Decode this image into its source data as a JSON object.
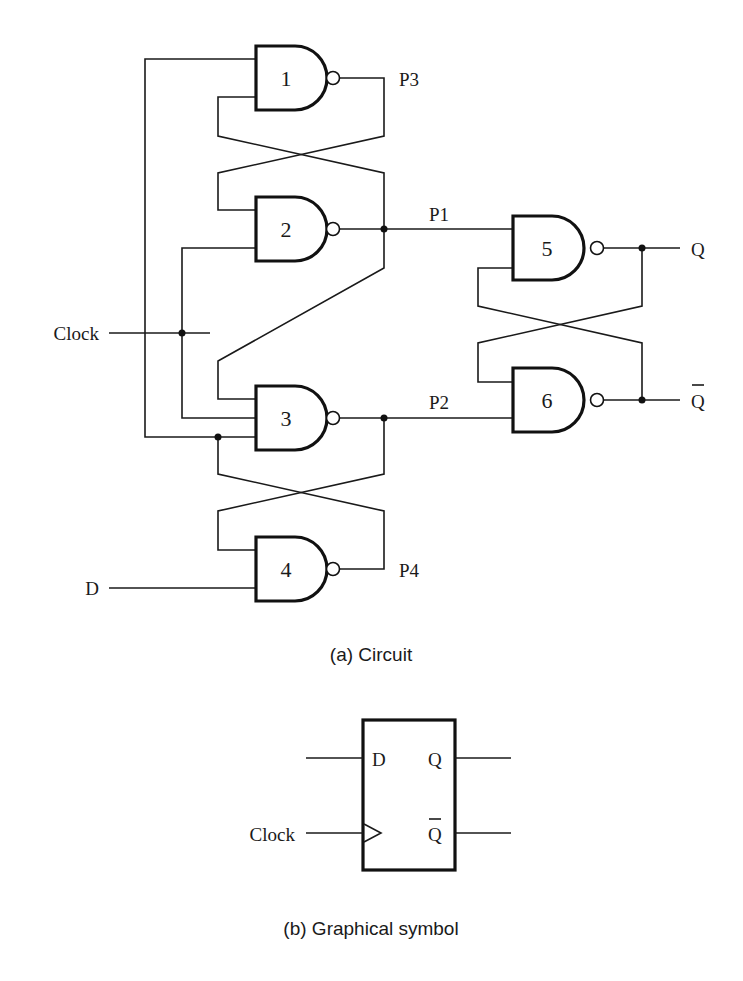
{
  "figure": {
    "caption_a": "(a) Circuit",
    "caption_b": "(b) Graphical symbol"
  },
  "circuit": {
    "gates": [
      {
        "id": "1",
        "type": "NAND"
      },
      {
        "id": "2",
        "type": "NAND"
      },
      {
        "id": "3",
        "type": "NAND"
      },
      {
        "id": "4",
        "type": "NAND"
      },
      {
        "id": "5",
        "type": "NAND"
      },
      {
        "id": "6",
        "type": "NAND"
      }
    ],
    "inputs": {
      "clock": "Clock",
      "d": "D"
    },
    "nodes": {
      "p1": "P1",
      "p2": "P2",
      "p3": "P3",
      "p4": "P4"
    },
    "outputs": {
      "q": "Q",
      "q_bar": "Q"
    }
  },
  "symbol": {
    "input_d": "D",
    "input_clock": "Clock",
    "output_q": "Q",
    "output_q_bar": "Q"
  },
  "colors": {
    "ink": "#111111",
    "background": "#ffffff"
  }
}
